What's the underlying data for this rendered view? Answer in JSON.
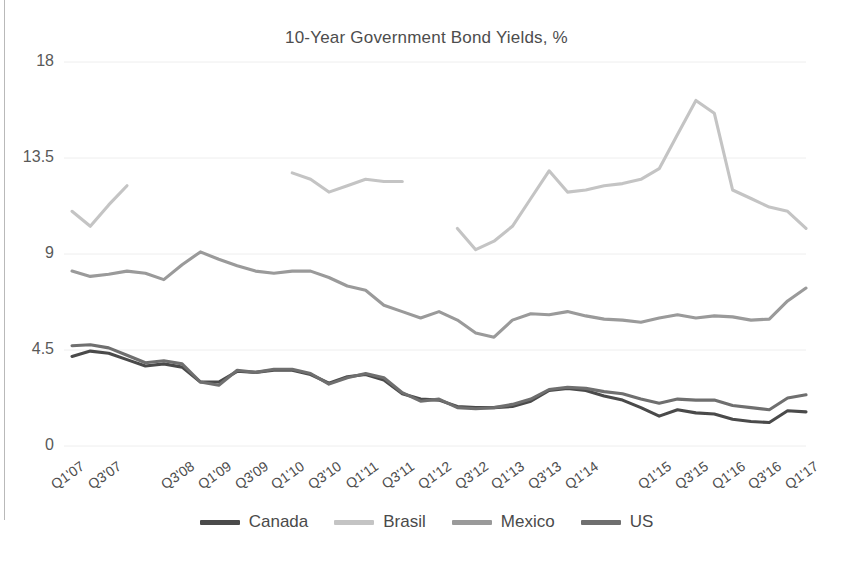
{
  "chart_data": {
    "type": "line",
    "title": "10-Year Government Bond Yields, %",
    "xlabel": "",
    "ylabel": "",
    "ylim": [
      0,
      18
    ],
    "yticks": [
      "0",
      "4.5",
      "9",
      "13.5",
      "18"
    ],
    "ytick_values": [
      0,
      4.5,
      9,
      13.5,
      18
    ],
    "grid": true,
    "legend_position": "bottom",
    "x": [
      "Q1'07",
      "Q2'07",
      "Q3'07",
      "Q4'07",
      "Q1'08",
      "Q2'08",
      "Q3'08",
      "Q4'08",
      "Q1'09",
      "Q2'09",
      "Q3'09",
      "Q4'09",
      "Q1'10",
      "Q2'10",
      "Q3'10",
      "Q4'10",
      "Q1'11",
      "Q2'11",
      "Q3'11",
      "Q4'11",
      "Q1'12",
      "Q2'12",
      "Q3'12",
      "Q4'12",
      "Q1'13",
      "Q2'13",
      "Q3'13",
      "Q4'13",
      "Q1'14",
      "Q2'14",
      "Q3'14",
      "Q4'14",
      "Q1'15",
      "Q2'15",
      "Q3'15",
      "Q4'15",
      "Q1'16",
      "Q2'16",
      "Q3'16",
      "Q4'16",
      "Q1'17"
    ],
    "xtick_labels": [
      "Q1'07",
      "Q3'07",
      "Q3'08",
      "Q1'09",
      "Q3'09",
      "Q1'10",
      "Q3'10",
      "Q1'11",
      "Q3'11",
      "Q1'12",
      "Q3'12",
      "Q1'13",
      "Q3'13",
      "Q1'14",
      "Q1'15",
      "Q3'15",
      "Q1'16",
      "Q3'16",
      "Q1'17"
    ],
    "xtick_indices": [
      0,
      2,
      6,
      8,
      10,
      12,
      14,
      16,
      18,
      20,
      22,
      24,
      26,
      28,
      32,
      34,
      36,
      38,
      40
    ],
    "series": [
      {
        "name": "Canada",
        "color": "#4a4a4a",
        "values": [
          4.2,
          4.45,
          4.35,
          4.05,
          3.75,
          3.85,
          3.7,
          3.0,
          3.0,
          3.5,
          3.45,
          3.55,
          3.55,
          3.35,
          2.95,
          3.25,
          3.35,
          3.1,
          2.45,
          2.2,
          2.15,
          1.85,
          1.8,
          1.8,
          1.85,
          2.1,
          2.6,
          2.7,
          2.6,
          2.35,
          2.15,
          1.8,
          1.4,
          1.7,
          1.55,
          1.5,
          1.25,
          1.15,
          1.1,
          1.65,
          1.6
        ]
      },
      {
        "name": "Brasil",
        "color": "#c4c4c4",
        "values": [
          11.0,
          10.3,
          11.3,
          12.2,
          null,
          null,
          null,
          null,
          null,
          null,
          null,
          null,
          12.8,
          12.5,
          11.9,
          12.2,
          12.5,
          12.4,
          12.4,
          null,
          null,
          10.2,
          9.2,
          9.6,
          10.3,
          11.6,
          12.9,
          11.9,
          12.0,
          12.2,
          12.3,
          12.5,
          13.0,
          14.6,
          16.2,
          15.6,
          12.0,
          11.6,
          11.2,
          11.0,
          10.2
        ]
      },
      {
        "name": "Mexico",
        "color": "#9a9a9a",
        "values": [
          8.2,
          7.95,
          8.05,
          8.2,
          8.1,
          7.8,
          8.5,
          9.1,
          8.75,
          8.45,
          8.2,
          8.1,
          8.2,
          8.2,
          7.9,
          7.5,
          7.3,
          6.6,
          6.3,
          6.0,
          6.3,
          5.9,
          5.3,
          5.1,
          5.9,
          6.2,
          6.15,
          6.3,
          6.1,
          5.95,
          5.9,
          5.8,
          6.0,
          6.15,
          6.0,
          6.1,
          6.05,
          5.9,
          5.95,
          6.8,
          7.4
        ]
      },
      {
        "name": "US",
        "color": "#6f6f6f",
        "values": [
          4.7,
          4.75,
          4.6,
          4.25,
          3.9,
          4.0,
          3.85,
          3.0,
          2.85,
          3.55,
          3.45,
          3.6,
          3.6,
          3.4,
          2.9,
          3.2,
          3.4,
          3.2,
          2.5,
          2.1,
          2.2,
          1.8,
          1.75,
          1.8,
          1.95,
          2.2,
          2.65,
          2.75,
          2.7,
          2.55,
          2.45,
          2.2,
          2.0,
          2.2,
          2.15,
          2.15,
          1.9,
          1.8,
          1.7,
          2.25,
          2.4
        ]
      }
    ]
  },
  "legend": {
    "items": [
      {
        "label": "Canada",
        "color": "#4a4a4a"
      },
      {
        "label": "Brasil",
        "color": "#c4c4c4"
      },
      {
        "label": "Mexico",
        "color": "#9a9a9a"
      },
      {
        "label": "US",
        "color": "#6f6f6f"
      }
    ]
  },
  "colors": {
    "grid": "#eeeeee",
    "text": "#4d4d4d",
    "background": "#ffffff"
  }
}
